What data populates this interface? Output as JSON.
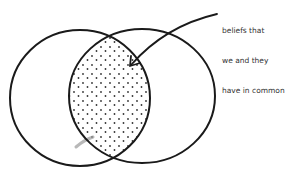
{
  "diagram": {
    "type": "venn",
    "sets": [
      {
        "name": "left-circle",
        "label": ""
      },
      {
        "name": "right-circle",
        "label": ""
      }
    ],
    "intersection": {
      "fill": "dotted",
      "annotation_lines": [
        "beliefs that",
        "we and they",
        "have in common"
      ]
    },
    "colors": {
      "stroke": "#1a1a1a",
      "dots": "#333333",
      "text": "#333333",
      "smudge": "#999999",
      "background": "#ffffff"
    }
  }
}
